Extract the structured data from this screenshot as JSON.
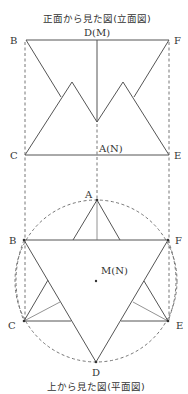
{
  "elevation": {
    "title": "正面から見た図(立面図)",
    "labels": {
      "top_center": "D(M)",
      "top_left": "B",
      "top_right": "F",
      "bottom_left": "C",
      "bottom_right": "E",
      "bottom_center": "A(N)"
    }
  },
  "plan": {
    "title": "上から見た図(平面図)",
    "labels": {
      "top": "A",
      "left_upper": "B",
      "right_upper": "F",
      "center": "M(N)",
      "left_lower": "C",
      "right_lower": "E",
      "bottom": "D"
    }
  },
  "colors": {
    "line": "#555555",
    "text": "#333333",
    "background": "#ffffff"
  }
}
